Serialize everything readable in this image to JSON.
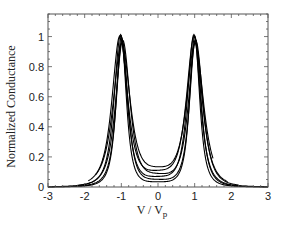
{
  "chart_data": {
    "type": "line",
    "title": "",
    "xlabel": "V / V",
    "xlabel_subscript": "p",
    "ylabel": "Normalized Conductance",
    "xlim": [
      -3,
      3
    ],
    "ylim": [
      0,
      1.15
    ],
    "xticks": [
      -3,
      -2,
      -1,
      0,
      1,
      2,
      3
    ],
    "xtick_labels": [
      "-3",
      "-2",
      "-1",
      "0",
      "1",
      "2",
      "3"
    ],
    "yticks": [
      0,
      0.2,
      0.4,
      0.6,
      0.8,
      1
    ],
    "ytick_labels": [
      "0",
      "0.2",
      "0.4",
      "0.6",
      "0.8",
      "1"
    ],
    "grid": false,
    "legend": null,
    "series": [
      {
        "name": "curve 1",
        "peak_left": -1.0,
        "peak_right": 1.0,
        "peak_height": 1.0,
        "width": 0.22,
        "min_center": 0.02,
        "x_range": [
          -3,
          3
        ]
      },
      {
        "name": "curve 2",
        "peak_left": -0.98,
        "peak_right": 1.02,
        "peak_height": 0.98,
        "width": 0.25,
        "min_center": 0.03,
        "x_range": [
          -3,
          3
        ]
      },
      {
        "name": "curve 3",
        "peak_left": -1.02,
        "peak_right": 0.98,
        "peak_height": 1.01,
        "width": 0.28,
        "min_center": 0.04,
        "x_range": [
          -3,
          3
        ]
      },
      {
        "name": "curve 4",
        "peak_left": -0.96,
        "peak_right": 1.03,
        "peak_height": 0.97,
        "width": 0.31,
        "min_center": 0.05,
        "x_range": [
          -2.2,
          2.2
        ]
      },
      {
        "name": "curve 5",
        "peak_left": -1.04,
        "peak_right": 0.99,
        "peak_height": 1.0,
        "width": 0.34,
        "min_center": 0.06,
        "x_range": [
          -1.9,
          1.9
        ]
      },
      {
        "name": "curve 6",
        "peak_left": -0.99,
        "peak_right": 1.01,
        "peak_height": 0.95,
        "width": 0.37,
        "min_center": 0.07,
        "x_range": [
          -1.7,
          1.5
        ]
      }
    ],
    "colors": {
      "line": "#000000",
      "axis": "#444444",
      "text": "#222222"
    }
  }
}
